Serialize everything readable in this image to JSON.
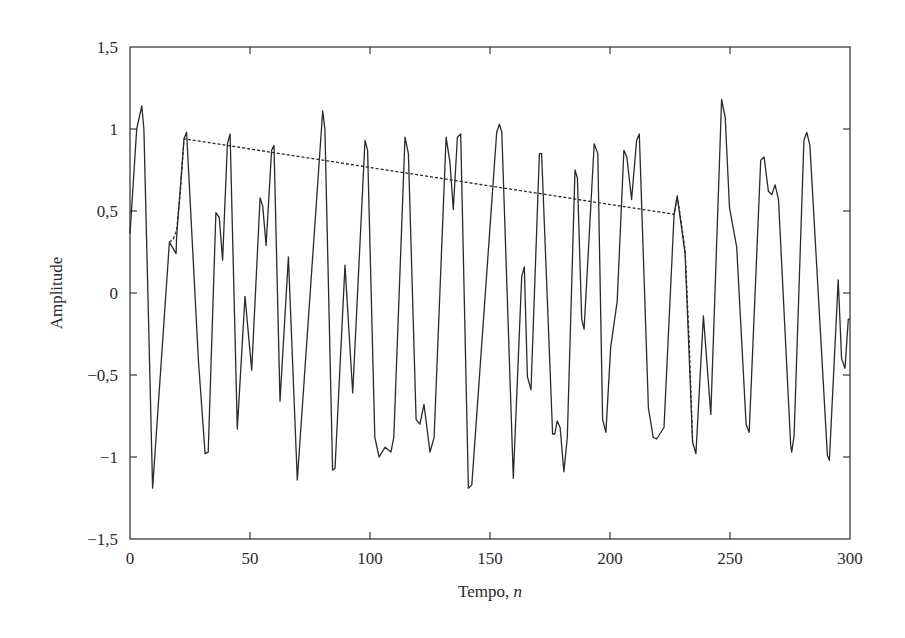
{
  "chart_data": {
    "type": "line",
    "title": "",
    "xlabel": "Tempo, ",
    "xlabel_italic": "n",
    "ylabel": "Amplitude",
    "xlim": [
      0,
      300
    ],
    "ylim": [
      -1.5,
      1.5
    ],
    "grid": false,
    "legend": null,
    "x_ticks": [
      0,
      50,
      100,
      150,
      200,
      250,
      300
    ],
    "x_tick_labels": [
      "0",
      "50",
      "100",
      "150",
      "200",
      "250",
      "300"
    ],
    "y_ticks": [
      1.5,
      1,
      0.5,
      0,
      -0.5,
      -1,
      -1.5
    ],
    "y_tick_labels": [
      "1,5",
      "1",
      "0,5",
      "0",
      "−0,5",
      "−1",
      "−1,5"
    ],
    "series": [
      {
        "name": "signal",
        "style": "solid",
        "color": "#2a2a2a",
        "x": [
          0,
          2.8,
          4.9,
          5.8,
          9.4,
          16.4,
          19.2,
          19.4,
          22.5,
          23.6,
          28.5,
          31.3,
          32.6,
          35.8,
          37.2,
          38.6,
          40.6,
          41.7,
          44.7,
          47.9,
          50.7,
          54.2,
          55.3,
          56.7,
          59,
          60,
          62.5,
          66,
          69.7,
          80.3,
          81.2,
          84.4,
          85.4,
          89.6,
          92.8,
          97.9,
          99,
          102,
          103.8,
          106.3,
          108.7,
          109.9,
          114.6,
          116,
          119.2,
          120.8,
          122.5,
          125,
          126.7,
          131.7,
          133.3,
          134.7,
          136.4,
          137.8,
          141,
          142.4,
          152.8,
          153.9,
          154.9,
          159.7,
          163.2,
          164.3,
          165.6,
          167.1,
          170.6,
          171.5,
          176.1,
          177,
          178,
          179.2,
          180.8,
          182.2,
          185.4,
          186.4,
          188.2,
          189.2,
          193.4,
          194.9,
          196.9,
          198.3,
          200.3,
          203,
          205.8,
          207,
          209,
          211.1,
          212.2,
          216,
          218,
          219.4,
          222.5,
          226.7,
          228,
          231.3,
          234.4,
          235.8,
          238.9,
          242,
          246.5,
          248,
          249.8,
          252.8,
          256.7,
          258,
          262.8,
          264.2,
          266,
          267.4,
          268.8,
          270.2,
          275.3,
          275.7,
          276.7,
          280.8,
          282,
          283.3,
          290.6,
          291.4,
          295.1,
          296.5,
          297.9,
          299.3,
          300
        ],
        "y": [
          0.36,
          1.0,
          1.14,
          1.0,
          -1.19,
          0.31,
          0.24,
          0.34,
          0.94,
          0.98,
          -0.41,
          -0.98,
          -0.97,
          0.49,
          0.46,
          0.2,
          0.91,
          0.97,
          -0.83,
          -0.02,
          -0.47,
          0.58,
          0.53,
          0.29,
          0.87,
          0.9,
          -0.66,
          0.22,
          -1.14,
          1.11,
          1.0,
          -1.08,
          -1.07,
          0.17,
          -0.61,
          0.93,
          0.87,
          -0.88,
          -1.0,
          -0.94,
          -0.97,
          -0.88,
          0.95,
          0.85,
          -0.77,
          -0.8,
          -0.68,
          -0.97,
          -0.88,
          0.95,
          0.8,
          0.51,
          0.95,
          0.97,
          -1.19,
          -1.17,
          0.98,
          1.03,
          0.98,
          -1.13,
          0.1,
          0.16,
          -0.51,
          -0.59,
          0.85,
          0.85,
          -0.86,
          -0.86,
          -0.78,
          -0.82,
          -1.09,
          -0.88,
          0.75,
          0.7,
          -0.16,
          -0.22,
          0.91,
          0.85,
          -0.77,
          -0.85,
          -0.33,
          -0.05,
          0.87,
          0.83,
          0.57,
          0.93,
          0.97,
          -0.7,
          -0.88,
          -0.89,
          -0.82,
          0.48,
          0.59,
          0.24,
          -0.91,
          -0.98,
          -0.14,
          -0.74,
          1.18,
          1.07,
          0.52,
          0.28,
          -0.8,
          -0.85,
          0.81,
          0.83,
          0.62,
          0.6,
          0.66,
          0.57,
          -0.93,
          -0.97,
          -0.87,
          0.93,
          0.98,
          0.9,
          -0.99,
          -1.02,
          0.08,
          -0.4,
          -0.46,
          -0.16,
          -0.16
        ]
      },
      {
        "name": "reconstruction",
        "style": "dashed",
        "color": "#2a2a2a",
        "x": [
          16.4,
          18,
          19.4,
          21,
          22.5,
          226.7,
          228,
          229.5,
          231.3,
          233,
          234.4
        ],
        "y": [
          0.31,
          0.33,
          0.38,
          0.62,
          0.94,
          0.48,
          0.59,
          0.45,
          0.26,
          -0.3,
          -0.91
        ]
      }
    ]
  }
}
